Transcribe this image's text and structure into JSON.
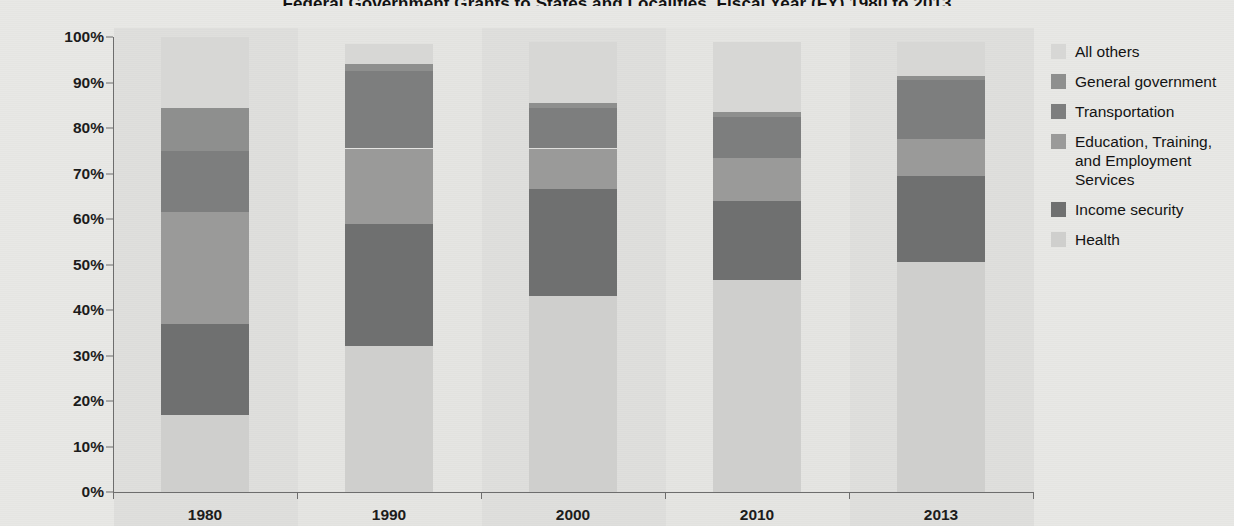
{
  "title": "Federal Government Grants to States and Localities, Fiscal Year (FY) 1980 to 2013",
  "chart_data": {
    "type": "bar",
    "subtype": "stacked-100-percent",
    "title": "Federal Government Grants to States and Localities, Fiscal Year (FY) 1980 to 2013",
    "xlabel": "",
    "ylabel": "",
    "categories": [
      "1980",
      "1990",
      "2000",
      "2010",
      "2013"
    ],
    "ylim": [
      0,
      100
    ],
    "ytick_labels": [
      "0%",
      "10%",
      "20%",
      "30%",
      "40%",
      "50%",
      "60%",
      "70%",
      "80%",
      "90%",
      "100%"
    ],
    "ytick_values": [
      0,
      10,
      20,
      30,
      40,
      50,
      60,
      70,
      80,
      90,
      100
    ],
    "grid": false,
    "legend_position": "right",
    "stack_order_bottom_to_top": [
      "Health",
      "Income security",
      "Education, Training, and Employment Services",
      "Transportation",
      "General government",
      "All others"
    ],
    "series": [
      {
        "name": "Health",
        "color": "#cfcfcd",
        "values": [
          17.0,
          32.0,
          43.0,
          46.5,
          50.5
        ]
      },
      {
        "name": "Income security",
        "color": "#6f7070",
        "values": [
          20.0,
          27.0,
          23.5,
          17.5,
          19.0
        ]
      },
      {
        "name": "Education, Training, and Employment Services",
        "color": "#9a9a99",
        "values": [
          24.5,
          16.5,
          9.0,
          9.5,
          8.0
        ]
      },
      {
        "name": "Transportation",
        "color": "#7d7e7e",
        "values": [
          13.5,
          17.0,
          9.0,
          9.0,
          13.0
        ]
      },
      {
        "name": "General government",
        "color": "#8e8f8e",
        "values": [
          9.5,
          1.5,
          1.0,
          1.0,
          1.0
        ]
      },
      {
        "name": "All others",
        "color": "#d7d7d5",
        "values": [
          15.5,
          4.5,
          13.5,
          15.5,
          7.5
        ]
      }
    ],
    "bar_tops_percent": [
      100.0,
      98.5,
      99.0,
      99.0,
      98.5
    ]
  },
  "legend": {
    "items": [
      {
        "label": "All others",
        "color": "#d7d7d5"
      },
      {
        "label": "General government",
        "color": "#8e8f8e"
      },
      {
        "label": "Transportation",
        "color": "#7d7e7e"
      },
      {
        "label": "Education, Training, and Employment Services",
        "color": "#9a9a99"
      },
      {
        "label": "Income security",
        "color": "#6f7070"
      },
      {
        "label": "Health",
        "color": "#cfcfcd"
      }
    ]
  },
  "axis": {
    "x_labels": [
      "1980",
      "1990",
      "2000",
      "2010",
      "2013"
    ],
    "y_labels": [
      "100%",
      "90%",
      "80%",
      "70%",
      "60%",
      "50%",
      "40%",
      "30%",
      "20%",
      "10%",
      "0%"
    ]
  }
}
